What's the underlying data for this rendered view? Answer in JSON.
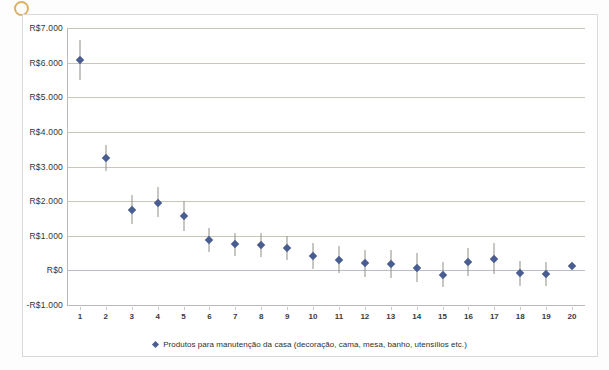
{
  "chart_data": {
    "type": "scatter",
    "title": "",
    "xlabel": "",
    "ylabel": "",
    "grid": true,
    "legend_position": "bottom",
    "legend": [
      "Produtos para manutenção da casa (decoração, cama, mesa, banho, utensílios etc.)"
    ],
    "marker_color": "#4a5d91",
    "errorbar_color": "#8f8f86",
    "gridline_color": "#c9c6b6",
    "ylim": [
      -1000,
      7000
    ],
    "ytick_values": [
      7000,
      6000,
      5000,
      4000,
      3000,
      2000,
      1000,
      0,
      -1000
    ],
    "ytick_labels": [
      "R$7.000",
      "R$6.000",
      "R$5.000",
      "R$4.000",
      "R$3.000",
      "R$2.000",
      "R$1.000",
      "R$0",
      "-R$1.000"
    ],
    "xlim": [
      0.5,
      20.5
    ],
    "categories": [
      "1",
      "2",
      "3",
      "4",
      "5",
      "6",
      "7",
      "8",
      "9",
      "10",
      "11",
      "12",
      "13",
      "14",
      "15",
      "16",
      "17",
      "18",
      "19",
      "20"
    ],
    "x": [
      1,
      2,
      3,
      4,
      5,
      6,
      7,
      8,
      9,
      10,
      11,
      12,
      13,
      14,
      15,
      16,
      17,
      18,
      19,
      20
    ],
    "values": [
      6080,
      3240,
      1750,
      1960,
      1570,
      870,
      750,
      730,
      640,
      420,
      300,
      200,
      180,
      70,
      -130,
      230,
      340,
      -90,
      -110,
      130
    ],
    "error_low": [
      5500,
      2880,
      1330,
      1530,
      1130,
      530,
      420,
      400,
      300,
      50,
      -90,
      -190,
      -210,
      -350,
      -490,
      -170,
      -110,
      -440,
      -460,
      130
    ],
    "error_high": [
      6660,
      3620,
      2180,
      2410,
      2000,
      1230,
      1090,
      1070,
      990,
      800,
      690,
      600,
      580,
      500,
      240,
      640,
      800,
      270,
      250,
      130
    ]
  },
  "legend": {
    "label": "Produtos para manutenção da casa (decoração, cama, mesa, banho, utensílios etc.)"
  }
}
